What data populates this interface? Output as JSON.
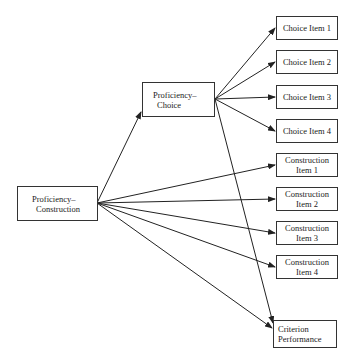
{
  "diagram": {
    "latent": {
      "construction": {
        "line1": "Proficiency–",
        "line2": "Construction"
      },
      "choice": {
        "line1": "Proficiency–",
        "line2": "Choice"
      }
    },
    "items": [
      {
        "label": "Choice Item 1"
      },
      {
        "label": "Choice Item 2"
      },
      {
        "label": "Choice Item 3"
      },
      {
        "label": "Choice Item 4"
      },
      {
        "line1": "Construction",
        "line2": "Item 1"
      },
      {
        "line1": "Construction",
        "line2": "Item 2"
      },
      {
        "line1": "Construction",
        "line2": "Item 3"
      },
      {
        "line1": "Construction",
        "line2": "Item 4"
      }
    ],
    "criterion": {
      "line1": "Criterion",
      "line2": "Performance"
    },
    "colors": {
      "line": "#222222",
      "border": "#333333",
      "background": "#ffffff"
    }
  }
}
